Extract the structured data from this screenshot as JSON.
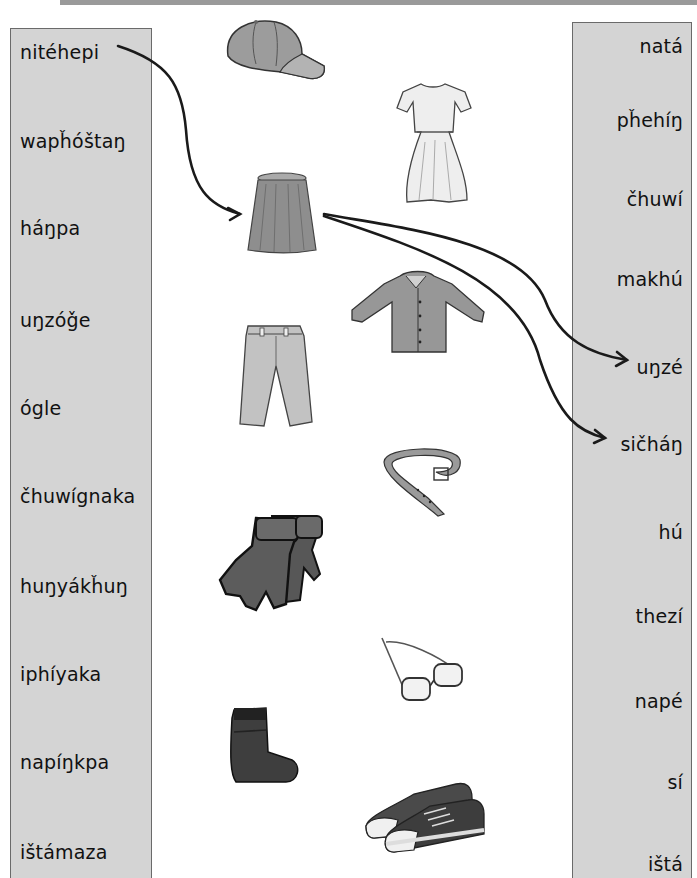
{
  "worksheet": {
    "left_column": {
      "words": [
        "nitéhepi",
        "wapȟóštaŋ",
        "háŋpa",
        "uŋzóǧe",
        "ógle",
        "čhuwígnaka",
        "huŋyákȟuŋ",
        "iphíyaka",
        "napíŋkpa",
        "ištámaza"
      ]
    },
    "right_column": {
      "words": [
        "natá",
        "pȟehíŋ",
        "čhuwí",
        "makhú",
        "uŋzé",
        "sičháŋ",
        "hú",
        "thezí",
        "napé",
        "sí",
        "ištá"
      ]
    },
    "pictures": [
      {
        "name": "cap",
        "icon": "cap-icon"
      },
      {
        "name": "dress",
        "icon": "dress-icon"
      },
      {
        "name": "skirt",
        "icon": "skirt-icon"
      },
      {
        "name": "shirt",
        "icon": "shirt-icon"
      },
      {
        "name": "pants",
        "icon": "pants-icon"
      },
      {
        "name": "belt",
        "icon": "belt-icon"
      },
      {
        "name": "gloves",
        "icon": "gloves-icon"
      },
      {
        "name": "glasses",
        "icon": "glasses-icon"
      },
      {
        "name": "sock",
        "icon": "sock-icon"
      },
      {
        "name": "sneakers",
        "icon": "sneakers-icon"
      }
    ],
    "arrows": [
      {
        "from": "nitéhepi",
        "to": "skirt"
      },
      {
        "from": "skirt",
        "to": "uŋzé"
      },
      {
        "from": "skirt",
        "to": "sičháŋ"
      }
    ],
    "colors": {
      "panel_fill": "#d4d4d4",
      "panel_border": "#6a6a6a",
      "top_bar": "#9a9a9a",
      "arrow": "#1a1a1a"
    }
  }
}
